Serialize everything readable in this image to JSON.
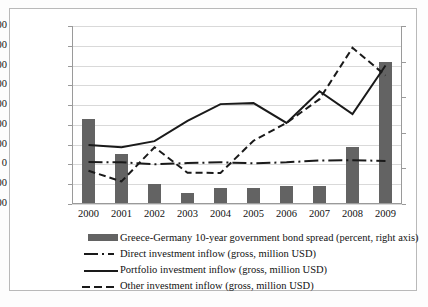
{
  "chart_data": {
    "type": "line",
    "title": "",
    "xlabel": "",
    "ylabel": "",
    "categories": [
      "2000",
      "2001",
      "2002",
      "2003",
      "2004",
      "2005",
      "2006",
      "2007",
      "2008",
      "2009"
    ],
    "left_axis": {
      "label": "million USD",
      "ylim": [
        -20000,
        70000
      ],
      "ticks": [
        -20000,
        -10000,
        0,
        10000,
        20000,
        30000,
        40000,
        50000,
        60000,
        70000
      ],
      "tick_labels": [
        "-20000",
        "-10000",
        "0",
        "10000",
        "20000",
        "30000",
        "40000",
        "50000",
        "60000",
        "70000"
      ]
    },
    "right_axis": {
      "label": "percent",
      "ylim": [
        0,
        2.5
      ],
      "ticks": [
        0,
        0.5,
        1,
        1.5,
        2,
        2.5
      ],
      "tick_labels": [
        "0",
        "0.5",
        "1",
        "1.5",
        "2",
        "2.5"
      ]
    },
    "grid": true,
    "legend_position": "bottom",
    "series": [
      {
        "name": "Greece-Germany 10-year government bond spread (percent, right axis)",
        "type": "bar",
        "axis": "right",
        "color": "#636363",
        "values": [
          1.2,
          0.7,
          0.28,
          0.15,
          0.22,
          0.22,
          0.26,
          0.25,
          0.8,
          2.0
        ]
      },
      {
        "name": "Direct investment inflow (gross, million USD)",
        "type": "line",
        "style": "dash-dot",
        "axis": "left",
        "color": "#1a1a1a",
        "values": [
          1200,
          1100,
          50,
          700,
          1100,
          600,
          1100,
          2000,
          2100,
          1800
        ]
      },
      {
        "name": "Portfolio investment inflow (gross, million USD)",
        "type": "line",
        "style": "solid",
        "axis": "left",
        "color": "#1a1a1a",
        "values": [
          9800,
          8700,
          11800,
          22000,
          30500,
          31000,
          21000,
          37000,
          25500,
          50000
        ]
      },
      {
        "name": "Other investment inflow (gross, million USD)",
        "type": "line",
        "style": "dashed",
        "axis": "left",
        "color": "#1a1a1a",
        "values": [
          -3200,
          -8600,
          8700,
          -4200,
          -4300,
          12000,
          21000,
          33000,
          59000,
          45000
        ]
      }
    ]
  },
  "axis": {
    "left_ticks": [
      "70000",
      "60000",
      "50000",
      "40000",
      "30000",
      "20000",
      "10000",
      "0",
      "-10000",
      "-20000"
    ],
    "right_ticks": [
      "2.5",
      "2",
      "1.5",
      "1",
      "0.5",
      "0"
    ],
    "x_labels": [
      "2000",
      "2001",
      "2002",
      "2003",
      "2004",
      "2005",
      "2006",
      "2007",
      "2008",
      "2009"
    ]
  },
  "legend": {
    "items": [
      {
        "label": "Greece-Germany 10-year government bond spread (percent, right axis)",
        "key": "bar-swatch"
      },
      {
        "label": "Direct investment inflow (gross, million USD)",
        "key": "dash-dot-line"
      },
      {
        "label": "Portfolio investment inflow (gross, million USD)",
        "key": "solid-line"
      },
      {
        "label": "Other investment inflow (gross, million USD)",
        "key": "dashed-line"
      }
    ]
  },
  "colors": {
    "bar": "#636363",
    "line": "#1a1a1a",
    "grid": "#d9d9d9",
    "frame": "#b9b9b9"
  }
}
